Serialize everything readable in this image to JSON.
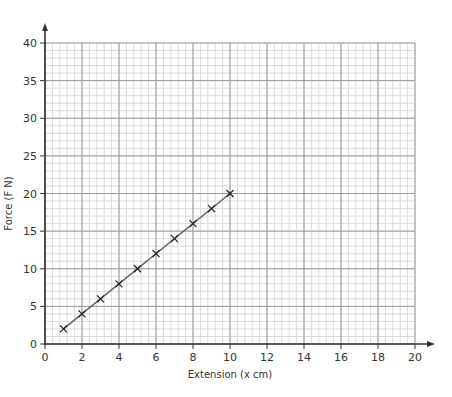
{
  "chart_data": {
    "type": "line",
    "title": "",
    "xlabel": "Extension (x cm)",
    "ylabel": "Force (F N)",
    "xlim": [
      0,
      20
    ],
    "ylim": [
      0,
      40
    ],
    "grid": true,
    "x_ticks": [
      0,
      2,
      4,
      6,
      8,
      10,
      12,
      14,
      16,
      18,
      20
    ],
    "y_ticks": [
      0,
      5,
      10,
      15,
      20,
      25,
      30,
      35,
      40
    ],
    "x_tick_labels": [
      "0",
      "2",
      "4",
      "6",
      "8",
      "10",
      "12",
      "14",
      "16",
      "18",
      "20"
    ],
    "y_tick_labels": [
      "0",
      "5",
      "10",
      "15",
      "20",
      "25",
      "30",
      "35",
      "40"
    ],
    "x_minor_step": 0.4,
    "y_minor_step": 1,
    "series": [
      {
        "name": "Force vs Extension",
        "marker": "x",
        "x": [
          1,
          2,
          3,
          4,
          5,
          6,
          7,
          8,
          9,
          10
        ],
        "y": [
          2,
          4,
          6,
          8,
          10,
          12,
          14,
          16,
          18,
          20
        ],
        "line": "best-fit",
        "color": "#555555"
      }
    ],
    "colors": {
      "axis": "#333333",
      "major_grid": "#9a9a9a",
      "minor_grid": "#d2d2d2",
      "marker": "#222222",
      "line": "#666666"
    }
  }
}
